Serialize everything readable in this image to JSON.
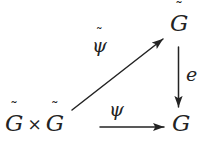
{
  "diagram": {
    "kind": "commutative-triangle",
    "background_color": "#ffffff",
    "ink_color": "#232323",
    "nodes": [
      {
        "id": "product",
        "role": "bottom-left",
        "text": "G̃ × G̃",
        "base_left": "G",
        "accent_left": "˜",
        "operator": "×",
        "base_right": "G",
        "accent_right": "˜"
      },
      {
        "id": "gtilde-top",
        "role": "top-right",
        "text": "G̃",
        "base": "G",
        "accent": "˜"
      },
      {
        "id": "g-bottom",
        "role": "bottom-right",
        "text": "G",
        "base": "G",
        "accent": ""
      }
    ],
    "arrows": [
      {
        "id": "diagonal",
        "from": "product",
        "to": "gtilde-top",
        "direction": "up-right",
        "label": "ψ̃",
        "label_base": "ψ",
        "label_accent": "˜"
      },
      {
        "id": "horizontal",
        "from": "product",
        "to": "g-bottom",
        "direction": "right",
        "label": "ψ",
        "label_base": "ψ",
        "label_accent": ""
      },
      {
        "id": "vertical",
        "from": "gtilde-top",
        "to": "g-bottom",
        "direction": "down",
        "label": "e",
        "label_base": "e",
        "label_accent": ""
      }
    ]
  }
}
